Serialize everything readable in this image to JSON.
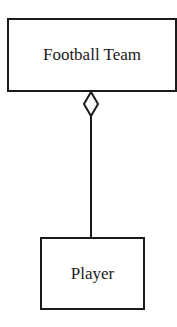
{
  "diagram": {
    "type": "UML aggregation",
    "classes": [
      {
        "id": "team",
        "label": "Football Team"
      },
      {
        "id": "player",
        "label": "Player"
      }
    ],
    "relationship": {
      "kind": "aggregation",
      "from": "Player",
      "to": "Football Team",
      "marker": "hollow diamond at Football Team end"
    },
    "colors": {
      "stroke": "#1a1a1a",
      "background": "#ffffff"
    }
  }
}
